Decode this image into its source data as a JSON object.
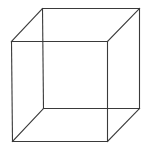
{
  "figure": {
    "title": "Necker cube",
    "width": 148,
    "height": 152,
    "background": "#ffffff",
    "stroke_color": "#3a3a3a"
  },
  "cube": {
    "vertices": {
      "front_top_left": [
        11,
        41
      ],
      "front_top_right": [
        107,
        41
      ],
      "front_bottom_left": [
        12,
        141
      ],
      "front_bottom_right": [
        107,
        141
      ],
      "back_top_left": [
        42,
        8
      ],
      "back_top_right": [
        139,
        8
      ],
      "back_bottom_left": [
        43,
        108
      ],
      "back_bottom_right": [
        139,
        108
      ]
    },
    "edges": [
      {
        "name": "front-top-edge",
        "from": "front_top_left",
        "to": "front_top_right"
      },
      {
        "name": "front-bottom-edge",
        "from": "front_bottom_left",
        "to": "front_bottom_right"
      },
      {
        "name": "front-left-edge",
        "from": "front_top_left",
        "to": "front_bottom_left"
      },
      {
        "name": "front-right-edge",
        "from": "front_top_right",
        "to": "front_bottom_right"
      },
      {
        "name": "back-top-edge",
        "from": "back_top_left",
        "to": "back_top_right"
      },
      {
        "name": "back-bottom-edge",
        "from": "back_bottom_left",
        "to": "back_bottom_right"
      },
      {
        "name": "back-left-edge",
        "from": "back_top_left",
        "to": "back_bottom_left"
      },
      {
        "name": "back-right-edge",
        "from": "back_top_right",
        "to": "back_bottom_right"
      },
      {
        "name": "top-left-connector",
        "from": "front_top_left",
        "to": "back_top_left"
      },
      {
        "name": "top-right-connector",
        "from": "front_top_right",
        "to": "back_top_right"
      },
      {
        "name": "bottom-left-connector",
        "from": "front_bottom_left",
        "to": "back_bottom_left"
      },
      {
        "name": "bottom-right-connector",
        "from": "front_bottom_right",
        "to": "back_bottom_right"
      }
    ]
  }
}
